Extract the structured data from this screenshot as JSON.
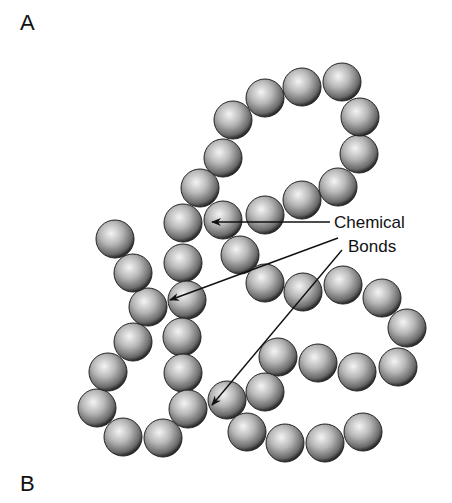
{
  "panels": {
    "top_label": "A",
    "bottom_label": "B"
  },
  "annotation": {
    "line1": "Chemical",
    "line2": "Bonds",
    "arrow_count": 3
  },
  "diagram": {
    "bead_color": "#9a9a9a",
    "bead_radius": 19,
    "beads": [
      [
        342,
        82
      ],
      [
        302,
        87
      ],
      [
        265,
        98
      ],
      [
        233,
        120
      ],
      [
        223,
        158
      ],
      [
        200,
        188
      ],
      [
        183,
        223
      ],
      [
        183,
        263
      ],
      [
        187,
        300
      ],
      [
        182,
        337
      ],
      [
        183,
        373
      ],
      [
        188,
        409
      ],
      [
        163,
        438
      ],
      [
        123,
        437
      ],
      [
        97,
        408
      ],
      [
        108,
        372
      ],
      [
        133,
        342
      ],
      [
        148,
        307
      ],
      [
        133,
        273
      ],
      [
        115,
        239
      ],
      [
        223,
        220
      ],
      [
        265,
        215
      ],
      [
        302,
        200
      ],
      [
        338,
        187
      ],
      [
        359,
        154
      ],
      [
        360,
        117
      ],
      [
        240,
        255
      ],
      [
        265,
        283
      ],
      [
        303,
        292
      ],
      [
        343,
        285
      ],
      [
        382,
        298
      ],
      [
        407,
        328
      ],
      [
        398,
        367
      ],
      [
        357,
        372
      ],
      [
        318,
        363
      ],
      [
        278,
        357
      ],
      [
        265,
        392
      ],
      [
        227,
        400
      ],
      [
        247,
        432
      ],
      [
        285,
        443
      ],
      [
        325,
        443
      ],
      [
        363,
        432
      ]
    ],
    "arrows": [
      {
        "from": [
          330,
          222
        ],
        "to": [
          212,
          222
        ]
      },
      {
        "from": [
          338,
          238
        ],
        "to": [
          170,
          300
        ]
      },
      {
        "from": [
          342,
          250
        ],
        "to": [
          212,
          405
        ]
      }
    ]
  }
}
